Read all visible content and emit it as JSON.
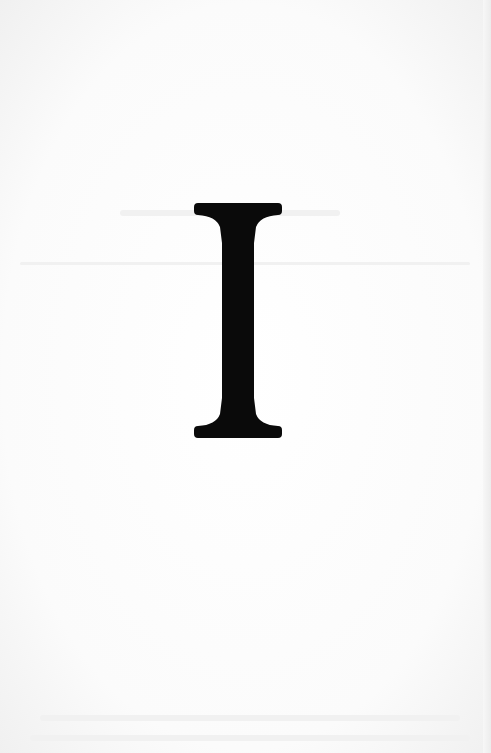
{
  "page": {
    "type": "scanned-page",
    "drop_initial": "I",
    "ink_color": "#0a0a0a",
    "paper_color": "#fbfbfb"
  }
}
